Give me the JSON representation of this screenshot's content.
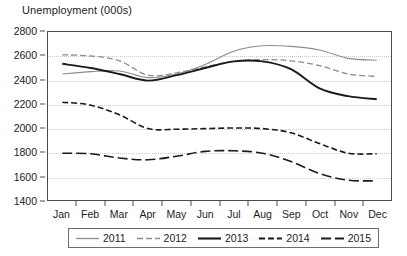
{
  "chart_data": {
    "type": "line",
    "title": "Unemployment (000s)",
    "xlabel": "",
    "ylabel": "",
    "ylim": [
      1400,
      2800
    ],
    "ytick_step": 200,
    "yticks": [
      2800,
      2600,
      2400,
      2200,
      2000,
      1800,
      1600,
      1400
    ],
    "ytick_labels": [
      "2800",
      "2600",
      "2400",
      "2200",
      "2000",
      "1800",
      "1600",
      "1400"
    ],
    "categories": [
      "Jan",
      "Feb",
      "Mar",
      "Apr",
      "May",
      "Jun",
      "Jul",
      "Aug",
      "Sep",
      "Oct",
      "Nov",
      "Dec"
    ],
    "grid": "horizontal-dotted",
    "legend_position": "bottom",
    "series": [
      {
        "name": "2011",
        "style": "solid-thin-gray",
        "color": "#8c8c8c",
        "values": [
          2450,
          2470,
          2475,
          2420,
          2450,
          2530,
          2640,
          2685,
          2680,
          2650,
          2580,
          2565
        ]
      },
      {
        "name": "2012",
        "style": "dashed-gray",
        "color": "#8c8c8c",
        "values": [
          2610,
          2600,
          2560,
          2440,
          2460,
          2510,
          2555,
          2570,
          2560,
          2520,
          2450,
          2430
        ]
      },
      {
        "name": "2013",
        "style": "solid-thick-black",
        "color": "#1b1b1b",
        "values": [
          2535,
          2500,
          2450,
          2395,
          2440,
          2500,
          2555,
          2555,
          2490,
          2330,
          2265,
          2240
        ]
      },
      {
        "name": "2014",
        "style": "dashed-short-black",
        "color": "#1b1b1b",
        "values": [
          2215,
          2190,
          2110,
          1995,
          1990,
          1995,
          2000,
          1995,
          1960,
          1870,
          1790,
          1785
        ]
      },
      {
        "name": "2015",
        "style": "dashed-long-black",
        "color": "#1b1b1b",
        "values": [
          1790,
          1785,
          1750,
          1735,
          1765,
          1805,
          1810,
          1790,
          1720,
          1620,
          1565,
          1560
        ]
      }
    ]
  },
  "legend": {
    "entries": [
      {
        "label": "2011"
      },
      {
        "label": "2012"
      },
      {
        "label": "2013"
      },
      {
        "label": "2014"
      },
      {
        "label": "2015"
      }
    ]
  }
}
